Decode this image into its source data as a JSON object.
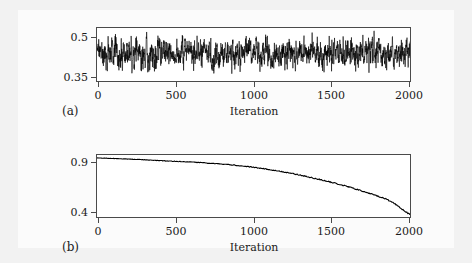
{
  "figure": {
    "background_color": "#f2f2f2",
    "inner_background_color": "#fbfbfb",
    "line_color": "#000000",
    "axis_color": "#4a4a4a"
  },
  "panels": {
    "a": {
      "letter": "(a)",
      "xlabel": "Iteration",
      "xticks": [
        "0",
        "500",
        "1000",
        "1500",
        "2000"
      ],
      "yticks": [
        "0.35",
        "0.5"
      ]
    },
    "b": {
      "letter": "(b)",
      "xlabel": "Iteration",
      "xticks": [
        "0",
        "500",
        "1000",
        "1500",
        "2000"
      ],
      "yticks": [
        "0.4",
        "0.9"
      ]
    }
  },
  "chart_data": [
    {
      "type": "line",
      "panel": "a",
      "title": "",
      "xlabel": "Iteration",
      "ylabel": "",
      "xlim": [
        0,
        2000
      ],
      "ylim": [
        0.32,
        0.525
      ],
      "xticks": [
        0,
        500,
        1000,
        1500,
        2000
      ],
      "yticks": [
        0.35,
        0.5
      ],
      "grid": false,
      "legend": "none",
      "series": [
        {
          "name": "trace",
          "description": "Noisy MCMC-style trace oscillating about a stationary mean of approximately 0.428 with spikes between 0.35 and 0.52",
          "mean": 0.428,
          "min": 0.348,
          "max": 0.515,
          "n_points": 2000,
          "x": [
            0,
            100,
            200,
            300,
            400,
            500,
            600,
            700,
            800,
            900,
            1000,
            1100,
            1200,
            1300,
            1400,
            1500,
            1600,
            1700,
            1800,
            1900,
            2000
          ],
          "values": [
            0.43,
            0.432,
            0.427,
            0.429,
            0.425,
            0.431,
            0.428,
            0.433,
            0.426,
            0.43,
            0.429,
            0.427,
            0.431,
            0.428,
            0.426,
            0.43,
            0.429,
            0.432,
            0.427,
            0.43,
            0.428
          ]
        }
      ]
    },
    {
      "type": "line",
      "panel": "b",
      "title": "",
      "xlabel": "Iteration",
      "ylabel": "",
      "xlim": [
        0,
        2000
      ],
      "ylim": [
        0.37,
        0.96
      ],
      "xticks": [
        0,
        500,
        1000,
        1500,
        2000
      ],
      "yticks": [
        0.4,
        0.9
      ],
      "grid": false,
      "legend": "none",
      "series": [
        {
          "name": "decay",
          "description": "Monotonically decreasing curve from about 0.93 at iteration 0 to about 0.39 at iteration 2000, with a gentle slope early and a steeper, slightly stepped decline after iteration 1000",
          "x": [
            0,
            50,
            100,
            150,
            200,
            250,
            300,
            350,
            400,
            450,
            500,
            550,
            600,
            650,
            700,
            750,
            800,
            850,
            900,
            950,
            1000,
            1050,
            1100,
            1150,
            1200,
            1250,
            1300,
            1350,
            1400,
            1450,
            1500,
            1550,
            1600,
            1650,
            1700,
            1750,
            1800,
            1850,
            1900,
            1950,
            2000
          ],
          "values": [
            0.932,
            0.93,
            0.927,
            0.924,
            0.921,
            0.918,
            0.915,
            0.911,
            0.907,
            0.903,
            0.9,
            0.897,
            0.893,
            0.889,
            0.884,
            0.879,
            0.873,
            0.867,
            0.86,
            0.852,
            0.843,
            0.833,
            0.822,
            0.81,
            0.797,
            0.783,
            0.768,
            0.752,
            0.735,
            0.717,
            0.699,
            0.68,
            0.66,
            0.638,
            0.614,
            0.59,
            0.566,
            0.54,
            0.5,
            0.445,
            0.392
          ]
        }
      ]
    }
  ]
}
